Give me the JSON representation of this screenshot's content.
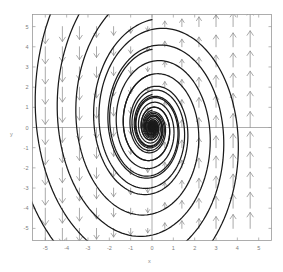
{
  "chart_data": {
    "type": "scatter",
    "plot_kind": "phase-portrait-quiver-streamlines",
    "title": "",
    "xlabel": "x",
    "ylabel": "y",
    "xlim": [
      -5.6,
      5.6
    ],
    "ylim": [
      -5.6,
      5.6
    ],
    "grid": false,
    "legend": null,
    "xticks": [
      -5,
      -4,
      -3,
      -2,
      -1,
      0,
      1,
      2,
      3,
      4,
      5
    ],
    "xticklabels": [
      "-5",
      "-4",
      "-3",
      "-2",
      "-1",
      "0",
      "1",
      "2",
      "3",
      "4",
      "5"
    ],
    "yticks": [
      -5,
      -4,
      -3,
      -2,
      -1,
      0,
      1,
      2,
      3,
      4,
      5
    ],
    "yticklabels": [
      "-5",
      "-4",
      "-3",
      "-2",
      "-1",
      "0",
      "1",
      "2",
      "3",
      "4",
      "5"
    ],
    "zero_axes_drawn": true,
    "vector_field": {
      "description": "quiver arrows: point down for x<0, up for x>0, magnitude grows with |x|",
      "grid_x": [
        -5.0,
        -4.2,
        -3.4,
        -2.6,
        -1.8,
        -1.0,
        -0.2,
        0.6,
        1.4,
        2.2,
        3.0,
        3.8,
        4.6
      ],
      "grid_y": [
        -5.0,
        -4.0,
        -3.0,
        -2.0,
        -1.0,
        0.0,
        1.0,
        2.0,
        3.0,
        4.0,
        5.0
      ],
      "u_expression": "0",
      "v_expression": "x",
      "arrow_color": "#8e8e8e"
    },
    "trajectories": {
      "count": 9,
      "shape": "clockwise inward spiral",
      "fixed_point": {
        "x": 0,
        "y": 0,
        "type": "stable spiral focus"
      },
      "curve_color": "#1a1a1a"
    },
    "spiral_params": {
      "a_decay": 0.155,
      "omega": 1.0,
      "x_scale": 1.0,
      "y_scale": 1.55,
      "start_radii": [
        0.55,
        1.05,
        1.7,
        2.5,
        3.45,
        4.5,
        5.6,
        6.9,
        8.3
      ],
      "start_phases": [
        0.0,
        0.0,
        0.0,
        0.0,
        0.0,
        0.0,
        0.0,
        0.0,
        0.0
      ]
    },
    "colors": {
      "background": "#ffffff",
      "frame": "#9a9a9a",
      "ticks": "#7d7d7d",
      "arrows": "#8e8e8e",
      "curves": "#1a1a1a",
      "zero_axis": "#8b8b8b"
    }
  },
  "labels": {
    "x_axis": "x",
    "y_axis": "y"
  }
}
